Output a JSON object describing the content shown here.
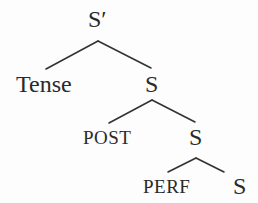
{
  "diagram": {
    "type": "syntax-tree",
    "stroke_color": "#333333",
    "text_color": "#2a2a2a",
    "nodes": [
      {
        "id": "n0",
        "label": "S′",
        "style": "large",
        "x": 88,
        "y": 7
      },
      {
        "id": "n1",
        "label": "Tense",
        "style": "large",
        "x": 16,
        "y": 72
      },
      {
        "id": "n2",
        "label": "S",
        "style": "large",
        "x": 145,
        "y": 72
      },
      {
        "id": "n3",
        "label": "POST",
        "style": "smallcaps",
        "x": 83,
        "y": 128
      },
      {
        "id": "n4",
        "label": "S",
        "style": "large",
        "x": 189,
        "y": 125
      },
      {
        "id": "n5",
        "label": "PERF",
        "style": "smallcaps",
        "x": 143,
        "y": 177
      },
      {
        "id": "n6",
        "label": "S",
        "style": "large",
        "x": 233,
        "y": 174
      }
    ],
    "edges": [
      {
        "from": "n0",
        "to": "n1",
        "x1": 98,
        "y1": 41,
        "x2": 46,
        "y2": 69
      },
      {
        "from": "n0",
        "to": "n2",
        "x1": 98,
        "y1": 41,
        "x2": 151,
        "y2": 68
      },
      {
        "from": "n2",
        "to": "n3",
        "x1": 152,
        "y1": 100,
        "x2": 109,
        "y2": 123
      },
      {
        "from": "n2",
        "to": "n4",
        "x1": 152,
        "y1": 100,
        "x2": 195,
        "y2": 122
      },
      {
        "from": "n4",
        "to": "n5",
        "x1": 196,
        "y1": 158,
        "x2": 168,
        "y2": 172
      },
      {
        "from": "n4",
        "to": "n6",
        "x1": 196,
        "y1": 158,
        "x2": 224,
        "y2": 172
      }
    ]
  }
}
